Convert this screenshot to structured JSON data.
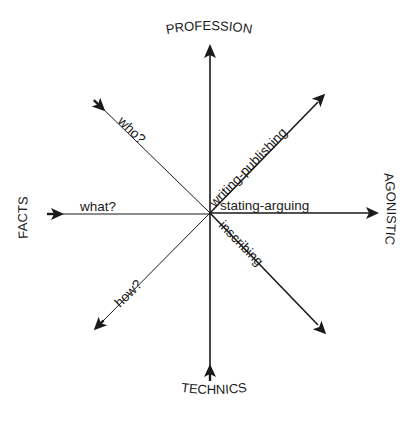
{
  "diagram": {
    "type": "radial-axes",
    "center": [
      210,
      213
    ],
    "poles": {
      "top": "PROFESSION",
      "bottom": "TECHNICS",
      "left": "FACTS",
      "right": "AGONISTIC"
    },
    "rays": [
      {
        "id": "who",
        "label": "who?",
        "direction": "upper-left",
        "arrow": "inward"
      },
      {
        "id": "what",
        "label": "what?",
        "direction": "left",
        "arrow": "inward"
      },
      {
        "id": "how",
        "label": "how?",
        "direction": "lower-left",
        "arrow": "outward"
      },
      {
        "id": "writing-publishing",
        "label": "writing-publishing",
        "direction": "upper-right",
        "arrow": "outward"
      },
      {
        "id": "stating-arguing",
        "label": "stating-arguing",
        "direction": "right",
        "arrow": "outward"
      },
      {
        "id": "inscribing",
        "label": "inscribing",
        "direction": "lower-right",
        "arrow": "outward"
      },
      {
        "id": "profession-axis",
        "label": "",
        "direction": "up",
        "arrow": "outward"
      },
      {
        "id": "technics-axis",
        "label": "",
        "direction": "down",
        "arrow": "inward"
      }
    ]
  },
  "colors": {
    "ink": "#1a1a1a",
    "background": "#ffffff"
  }
}
